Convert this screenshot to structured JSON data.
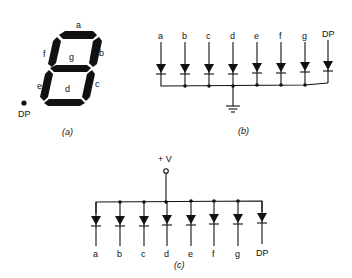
{
  "figure_a": {
    "caption": "(a)",
    "segment_labels": {
      "a": "a",
      "b": "b",
      "c": "c",
      "d": "d",
      "e": "e",
      "f": "f",
      "g": "g"
    },
    "dp_label": "DP"
  },
  "figure_b": {
    "caption": "(b)",
    "type": "common-cathode",
    "inputs": [
      "a",
      "b",
      "c",
      "d",
      "e",
      "f",
      "g",
      "DP"
    ]
  },
  "figure_c": {
    "caption": "(c)",
    "type": "common-anode",
    "supply_label": "+ V",
    "outputs": [
      "a",
      "b",
      "c",
      "d",
      "e",
      "f",
      "g",
      "DP"
    ]
  },
  "colors": {
    "ink": "#111111",
    "background": "#ffffff"
  }
}
